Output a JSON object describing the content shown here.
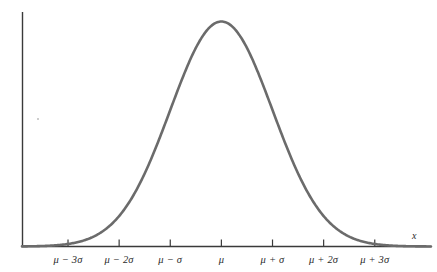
{
  "figure": {
    "background_color": "#ffffff",
    "curve_color": "#6b6b6b",
    "axis_color": "#3a3a3a",
    "label_color": "#2b2b2b"
  },
  "axis": {
    "x_title": "x",
    "tick_labels": [
      "μ − 3σ",
      "μ − 2σ",
      "μ − σ",
      "μ",
      "μ + σ",
      "μ + 2σ",
      "μ + 3σ"
    ]
  },
  "chart_data": {
    "type": "line",
    "title": "",
    "subtitle": "",
    "xlabel": "x",
    "ylabel": "",
    "grid": false,
    "legend": null,
    "annotations": [],
    "distribution": "normal",
    "mean_symbol": "μ",
    "sigma_symbol": "σ",
    "xlim": [
      -3.9,
      4.1
    ],
    "ylim": [
      0,
      1.05
    ],
    "x_tick_values": [
      -3,
      -2,
      -1,
      0,
      1,
      2,
      3
    ],
    "x_tick_labels": [
      "μ − 3σ",
      "μ − 2σ",
      "μ − σ",
      "μ",
      "μ + σ",
      "μ + 2σ",
      "μ + 3σ"
    ],
    "y_tick_values": [],
    "y_tick_labels": [],
    "series": [
      {
        "name": "normal density",
        "formula": "exp(-x^2/2)",
        "x": [
          -3.9,
          -3.6,
          -3.3,
          -3.0,
          -2.7,
          -2.4,
          -2.1,
          -1.8,
          -1.5,
          -1.2,
          -0.9,
          -0.6,
          -0.3,
          0.0,
          0.3,
          0.6,
          0.9,
          1.2,
          1.5,
          1.8,
          2.1,
          2.4,
          2.7,
          3.0,
          3.3,
          3.6,
          3.9
        ],
        "y": [
          0.0005,
          0.0015,
          0.0043,
          0.0111,
          0.0265,
          0.0561,
          0.1103,
          0.1979,
          0.3247,
          0.4868,
          0.667,
          0.8353,
          0.956,
          1.0,
          0.956,
          0.8353,
          0.667,
          0.4868,
          0.3247,
          0.1979,
          0.1103,
          0.0561,
          0.0265,
          0.0111,
          0.0043,
          0.0015,
          0.0005
        ]
      }
    ]
  }
}
